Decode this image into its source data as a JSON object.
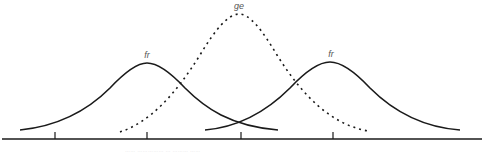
{
  "diagram": {
    "type": "overlapping-distributions",
    "curves": [
      {
        "id": "fr-left",
        "label": "fr",
        "style": "solid",
        "peak_x": 147,
        "peak_y": 63,
        "start_x": 20,
        "end_x": 278
      },
      {
        "id": "ge",
        "label": "ge",
        "style": "dotted",
        "peak_x": 239,
        "peak_y": 14,
        "start_x": 120,
        "end_x": 368
      },
      {
        "id": "fr-right",
        "label": "fr",
        "style": "solid",
        "peak_x": 330,
        "peak_y": 62,
        "start_x": 205,
        "end_x": 460
      }
    ],
    "axis": {
      "y": 139,
      "x_start": 2,
      "x_end": 482,
      "ticks_x": [
        55,
        147,
        241,
        333
      ]
    },
    "caption": "…… …………… … ……… ……"
  },
  "colors": {
    "line": "#1a1a1a",
    "label": "#555555"
  }
}
